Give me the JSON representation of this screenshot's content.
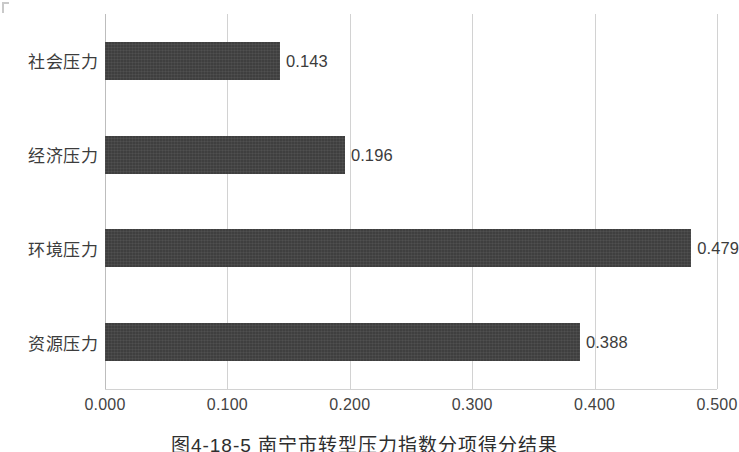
{
  "chart_data": {
    "type": "bar",
    "orientation": "horizontal",
    "title": "",
    "xlabel": "",
    "ylabel": "",
    "categories": [
      "社会压力",
      "经济压力",
      "环境压力",
      "资源压力"
    ],
    "values": [
      0.143,
      0.196,
      0.479,
      0.388
    ],
    "value_labels": [
      "0.143",
      "0.196",
      "0.479",
      "0.388"
    ],
    "xlim": [
      0.0,
      0.5
    ],
    "xticks": [
      0.0,
      0.1,
      0.2,
      0.3,
      0.4,
      0.5
    ],
    "xtick_labels": [
      "0.000",
      "0.100",
      "0.200",
      "0.300",
      "0.400",
      "0.500"
    ],
    "grid": "vertical",
    "legend": null,
    "bar_color": "#3f3f3f",
    "gridline_color": "#d2d2d2",
    "text_color": "#3c3c3c"
  },
  "caption": {
    "text": "图4-18-5  南宁市转型压力指数分项得分结果"
  }
}
